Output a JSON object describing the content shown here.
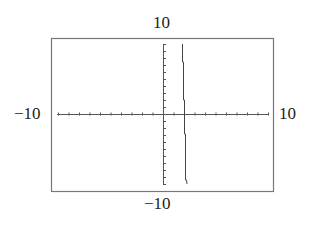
{
  "window": {
    "ymax_label": "10",
    "ymin_label": "−10",
    "xmin_label": "−10",
    "xmax_label": "10"
  },
  "chart_data": {
    "type": "line",
    "title": "",
    "xlabel": "",
    "ylabel": "",
    "xlim": [
      -10,
      10
    ],
    "ylim": [
      -10,
      10
    ],
    "xscale_ticks": 1,
    "yscale_ticks": 1,
    "grid": false,
    "legend": null,
    "series": [
      {
        "name": "graph",
        "description": "Nearly vertical steep curve crossing x-axis near x≈2, drawn in stepped pixels from top to bottom of window",
        "x": [
          1.9,
          1.95,
          2.0,
          2.05,
          2.1,
          2.2,
          2.25
        ],
        "y": [
          10,
          7,
          2,
          0,
          -2,
          -7,
          -10
        ]
      }
    ],
    "colors": {
      "axis": "#555555",
      "curve": "#444444",
      "frame": "#777777"
    }
  }
}
